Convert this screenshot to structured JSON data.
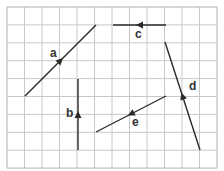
{
  "grid": {
    "origin_x": 7,
    "origin_y": 7,
    "cell_w": 17.5,
    "cell_h": 17.9,
    "cols": 12,
    "rows": 9,
    "line_color": "#c8c8c8",
    "border_color": "#b0b0b0"
  },
  "vectors": [
    {
      "id": "a",
      "label": "a",
      "x1": 25,
      "y1": 96,
      "x2": 96,
      "y2": 25,
      "arrow_dir": "up-right",
      "label_x": 50,
      "label_y": 57
    },
    {
      "id": "b",
      "label": "b",
      "x1": 78,
      "y1": 150,
      "x2": 78,
      "y2": 79,
      "arrow_dir": "up",
      "label_x": 66,
      "label_y": 117
    },
    {
      "id": "c",
      "label": "c",
      "x1": 166,
      "y1": 25,
      "x2": 113,
      "y2": 25,
      "arrow_dir": "left",
      "label_x": 135,
      "label_y": 38
    },
    {
      "id": "d",
      "label": "d",
      "x1": 200,
      "y1": 150,
      "x2": 165,
      "y2": 42,
      "arrow_dir": "up",
      "label_x": 189,
      "label_y": 90
    },
    {
      "id": "e",
      "label": "e",
      "x1": 166,
      "y1": 96,
      "x2": 96,
      "y2": 132,
      "arrow_dir": "down-left",
      "label_x": 132,
      "label_y": 126
    }
  ],
  "line_color": "#2a2a2a"
}
